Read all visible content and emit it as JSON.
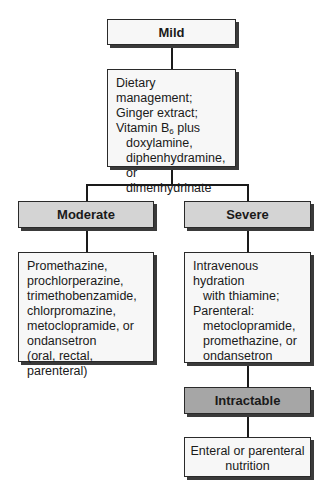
{
  "diagram": {
    "type": "flowchart",
    "nodes": {
      "mild": {
        "label": "Mild",
        "style": "header-white"
      },
      "mild_treatment": {
        "lines": [
          {
            "text": "Dietary management;",
            "indent": false
          },
          {
            "text": "Ginger extract;",
            "indent": false
          },
          {
            "text_pre": "Vitamin B",
            "subscript": "6",
            "text_post": " plus",
            "indent": false
          },
          {
            "text": "doxylamine,",
            "indent": true
          },
          {
            "text": "diphenhydramine, or",
            "indent": true
          },
          {
            "text": "dimenhydrinate",
            "indent": true
          }
        ]
      },
      "moderate": {
        "label": "Moderate",
        "style": "header-light-gray"
      },
      "moderate_treatment": {
        "lines": [
          {
            "text": "Promethazine,",
            "indent": false
          },
          {
            "text": "prochlorperazine,",
            "indent": false
          },
          {
            "text": "trimethobenzamide,",
            "indent": false
          },
          {
            "text": "chlorpromazine,",
            "indent": false
          },
          {
            "text": "metoclopramide, or",
            "indent": false
          },
          {
            "text": "ondansetron",
            "indent": false
          },
          {
            "text": "(oral, rectal, parenteral)",
            "indent": false
          }
        ]
      },
      "severe": {
        "label": "Severe",
        "style": "header-light-gray"
      },
      "severe_treatment": {
        "lines": [
          {
            "text": "Intravenous hydration",
            "indent": false
          },
          {
            "text": "with thiamine;",
            "indent": true
          },
          {
            "text": "Parenteral:",
            "indent": false
          },
          {
            "text": "metoclopramide,",
            "indent": true
          },
          {
            "text": "promethazine, or",
            "indent": true
          },
          {
            "text": "ondansetron",
            "indent": true
          }
        ]
      },
      "intractable": {
        "label": "Intractable",
        "style": "header-dark-gray"
      },
      "intractable_treatment": {
        "lines": [
          {
            "text": "Enteral or parenteral"
          },
          {
            "text": "nutrition"
          }
        ]
      }
    },
    "edges": [
      [
        "mild",
        "mild_treatment"
      ],
      [
        "mild_treatment",
        "moderate"
      ],
      [
        "mild_treatment",
        "severe"
      ],
      [
        "moderate",
        "moderate_treatment"
      ],
      [
        "severe",
        "severe_treatment"
      ],
      [
        "severe_treatment",
        "intractable"
      ],
      [
        "intractable",
        "intractable_treatment"
      ]
    ],
    "colors": {
      "header_white": "#f7f7f7",
      "header_light_gray": "#d4d4d4",
      "header_dark_gray": "#a6a6a6",
      "border": "#2a2a2a"
    }
  }
}
